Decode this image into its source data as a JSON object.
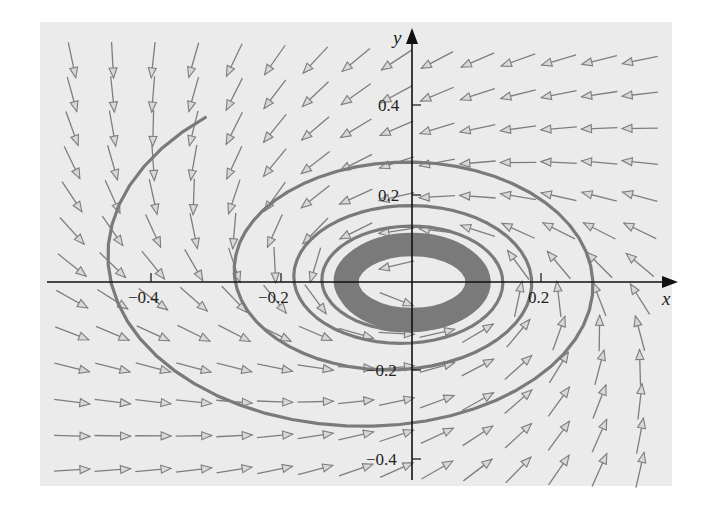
{
  "chart_data": {
    "type": "vector_field",
    "title": "",
    "xlabel": "x",
    "ylabel": "y",
    "xlim": [
      -0.55,
      0.4
    ],
    "ylim": [
      -0.45,
      0.55
    ],
    "x_ticks": [
      -0.4,
      -0.2,
      0.2
    ],
    "x_tick_labels": [
      "−0.4",
      "−0.2",
      "0.2"
    ],
    "y_ticks": [
      0.4,
      0.2,
      -0.2,
      -0.4
    ],
    "y_tick_labels": [
      "0.4",
      "0.2",
      "−0.2",
      "−0.4"
    ],
    "grid": false,
    "legend": null,
    "field": {
      "style": "normalized arrows on regular grid",
      "grid_cols": 15,
      "grid_rows": 13,
      "rotation": "counterclockwise",
      "behavior": "spiral toward limit cycle"
    },
    "trajectory": {
      "start": [
        -0.35,
        0.52
      ],
      "direction": "counterclockwise inward",
      "leftmost_x_on_axis": -0.51,
      "bottom_y_on_axis": -0.41,
      "rightmost_x_on_axis": 0.35,
      "successive_top_crossings_y": [
        0.3,
        0.21,
        0.16
      ],
      "successive_left_crossings_x": [
        -0.27,
        -0.2,
        -0.16
      ],
      "limit_cycle": {
        "rx": 0.1,
        "ry": 0.085,
        "band_width": 0.04
      }
    },
    "colors": {
      "panel": "#ebebeb",
      "arrows": "#7e7e7e",
      "trajectory": "#7a7a7a",
      "axes": "#111111"
    }
  },
  "axes": {
    "x_label": "x",
    "y_label": "y",
    "x_tick_labels": [
      "−0.4",
      "−0.2",
      "0.2"
    ],
    "y_tick_labels": [
      "0.4",
      "0.2",
      "−0.2",
      "−0.4"
    ]
  }
}
